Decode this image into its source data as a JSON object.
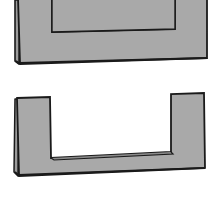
{
  "figure": {
    "colors": {
      "fill": "#a9a9a9",
      "fill_back": "#9c9c9c",
      "stroke": "#1a1a1a",
      "window": "#ffffff",
      "background": "#ffffff"
    },
    "shapes": [
      {
        "name": "folded-mat-with-window",
        "kind": "rectangular mat with rectangular window cut-out (cropped at top)"
      },
      {
        "name": "folded-u-shaped-mat",
        "kind": "U-shaped mat (window open at top)"
      }
    ]
  }
}
